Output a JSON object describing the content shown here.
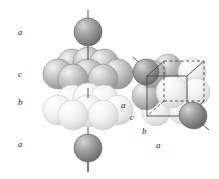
{
  "figure": {
    "type": "close-packed-sphere-stacking-diagram",
    "background_color": "#ffffff",
    "panels": [
      {
        "id": "left-panel",
        "name": "exploded-layer-stack",
        "description": "Vertical stack of close-packed sphere layers pierced by a body-diagonal axis line",
        "axis_line": {
          "x": 88,
          "y_top": 10,
          "y_bottom": 172,
          "color": "#555555"
        },
        "layer_labels": [
          {
            "text": "a",
            "x": 18,
            "y": 28
          },
          {
            "text": "c",
            "x": 18,
            "y": 70
          },
          {
            "text": "b",
            "x": 18,
            "y": 98
          },
          {
            "text": "a",
            "x": 18,
            "y": 140
          }
        ],
        "layers": [
          {
            "label": "a",
            "kind": "single-sphere",
            "shade": "dark",
            "color": "#8d8d8d",
            "cy": 32,
            "r": 14
          },
          {
            "label": "c",
            "kind": "triangle-layer",
            "shade": "medium",
            "color": "#b6b6b6",
            "cy": 74,
            "r": 16
          },
          {
            "label": "b",
            "kind": "triangle-layer",
            "shade": "light",
            "color": "#eeeeee",
            "cy": 110,
            "r": 16
          },
          {
            "label": "a",
            "kind": "single-sphere",
            "shade": "dark",
            "color": "#8d8d8d",
            "cy": 148,
            "r": 14
          }
        ]
      },
      {
        "id": "right-panel",
        "name": "unit-cell-overlay",
        "description": "Same sphere cluster drawn compactly with a face-centred cubic unit cell outlined, solid front edges and dashed hidden edges",
        "diagonal_line": {
          "x1": 133,
          "y1": 58,
          "x2": 207,
          "y2": 129,
          "color": "#555555"
        },
        "cube": {
          "edge_color": "#4a4a4a",
          "hidden_edge_style": "dashed",
          "front_face": {
            "x": 147,
            "y": 76,
            "w": 40,
            "h": 40
          },
          "depth_offset": {
            "dx": 17,
            "dy": -15
          }
        },
        "layer_labels": [
          {
            "text": "a",
            "x": 121,
            "y": 101
          },
          {
            "text": "c",
            "x": 130,
            "y": 113
          },
          {
            "text": "b",
            "x": 142,
            "y": 127
          },
          {
            "text": "a",
            "x": 156,
            "y": 141
          }
        ]
      }
    ],
    "palette": {
      "dark_sphere": "#8d8d8d",
      "dark_sphere_edge": "#6e6e6e",
      "medium_sphere": "#bdbdbd",
      "medium_sphere_edge": "#949494",
      "light_sphere": "#f1f1f1",
      "light_sphere_edge": "#c9c9c9",
      "line": "#555555",
      "cube_edge": "#4a4a4a",
      "label_text": "#2b2b2b"
    }
  }
}
